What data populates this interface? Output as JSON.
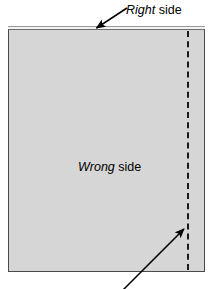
{
  "figure": {
    "background_color": "#ffffff",
    "fabric": {
      "fill_color": "#d6d6d6",
      "border_color": "#4a4a4a",
      "hem_color": "#f2f2f2"
    },
    "stitch_line": {
      "style": "dashed",
      "color": "#1a1a1a"
    },
    "labels": {
      "right_side": {
        "emphasis": "Right",
        "rest": " side"
      },
      "wrong_side": {
        "emphasis": "Wrong",
        "rest": " side"
      }
    },
    "arrows": {
      "top_leader": "leader-line-to-top-edge",
      "bottom_leader": "leader-line-to-stitch-line"
    }
  }
}
